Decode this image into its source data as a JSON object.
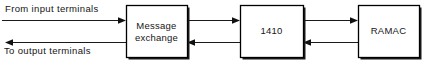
{
  "diagram": {
    "canvas": {
      "width": 431,
      "height": 68,
      "background": "#ffffff"
    },
    "stroke_color": "#000000",
    "text_color": "#141414",
    "boxes": [
      {
        "id": "message-exchange",
        "label_line1": "Message",
        "label_line2": "exchange",
        "x": 126,
        "y": 5,
        "width": 61,
        "height": 52
      },
      {
        "id": "1410",
        "label_line1": "1410",
        "label_line2": "",
        "x": 240,
        "y": 5,
        "width": 63,
        "height": 52
      },
      {
        "id": "ramac",
        "label_line1": "RAMAC",
        "label_line2": "",
        "x": 358,
        "y": 5,
        "width": 61,
        "height": 52
      }
    ],
    "edge_labels": {
      "input": "From input terminals",
      "output": "To output terminals"
    },
    "connections": [
      {
        "id": "input-to-exchange",
        "from": "input terminals",
        "to": "message-exchange",
        "direction": "right",
        "y": 20
      },
      {
        "id": "exchange-to-output",
        "from": "message-exchange",
        "to": "output terminals",
        "direction": "left",
        "y": 42
      },
      {
        "id": "exchange-to-1410",
        "from": "message-exchange",
        "to": "1410",
        "direction": "right",
        "y": 20
      },
      {
        "id": "1410-to-exchange",
        "from": "1410",
        "to": "message-exchange",
        "direction": "left",
        "y": 42
      },
      {
        "id": "1410-to-ramac",
        "from": "1410",
        "to": "ramac",
        "direction": "right",
        "y": 20
      },
      {
        "id": "ramac-to-1410",
        "from": "ramac",
        "to": "1410",
        "direction": "left",
        "y": 42
      }
    ]
  }
}
